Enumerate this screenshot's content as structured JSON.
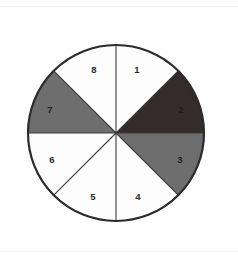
{
  "figure": {
    "name": "eight-sector-shaded-disk",
    "background_color": "#fefefe",
    "circle": {
      "center_x": 116,
      "center_y": 133,
      "radius": 88,
      "outline_color": "#2b2b2b",
      "outline_width": 2.2
    },
    "divider_color": "#3a3a3a",
    "divider_width": 1.1,
    "palette": {
      "white": "#fdfdfd",
      "gray": "#6e6e6e",
      "dark": "#332c2a",
      "label_dark": "#2a2a2a",
      "label_light": "#1a1a1a"
    },
    "sectors": [
      {
        "label": "1",
        "start_angle": 270,
        "end_angle": 315,
        "fill": "#fdfdfd",
        "shade": "white",
        "label_x": 137,
        "label_y": 70,
        "label_color": "#2a2a2a"
      },
      {
        "label": "2",
        "start_angle": 315,
        "end_angle": 360,
        "fill": "#332c2a",
        "shade": "dark",
        "label_x": 181,
        "label_y": 110,
        "label_color": "#1a1a1a"
      },
      {
        "label": "3",
        "start_angle": 0,
        "end_angle": 45,
        "fill": "#6e6e6e",
        "shade": "gray",
        "label_x": 180,
        "label_y": 160,
        "label_color": "#1f1f1f"
      },
      {
        "label": "4",
        "start_angle": 45,
        "end_angle": 90,
        "fill": "#fdfdfd",
        "shade": "white",
        "label_x": 138,
        "label_y": 197,
        "label_color": "#2a2a2a"
      },
      {
        "label": "5",
        "start_angle": 90,
        "end_angle": 135,
        "fill": "#fdfdfd",
        "shade": "white",
        "label_x": 93,
        "label_y": 197,
        "label_color": "#2a2a2a"
      },
      {
        "label": "6",
        "start_angle": 135,
        "end_angle": 180,
        "fill": "#fdfdfd",
        "shade": "white",
        "label_x": 52,
        "label_y": 160,
        "label_color": "#2a2a2a"
      },
      {
        "label": "7",
        "start_angle": 180,
        "end_angle": 225,
        "fill": "#6e6e6e",
        "shade": "gray",
        "label_x": 50,
        "label_y": 110,
        "label_color": "#1f1f1f"
      },
      {
        "label": "8",
        "start_angle": 225,
        "end_angle": 270,
        "fill": "#fdfdfd",
        "shade": "white",
        "label_x": 94,
        "label_y": 70,
        "label_color": "#2a2a2a"
      }
    ]
  },
  "chart_data": {
    "type": "pie",
    "title": "",
    "xlabel": "",
    "ylabel": "",
    "categories": [
      "1",
      "2",
      "3",
      "4",
      "5",
      "6",
      "7",
      "8"
    ],
    "values": [
      12.5,
      12.5,
      12.5,
      12.5,
      12.5,
      12.5,
      12.5,
      12.5
    ],
    "units": "percent",
    "slice_count": 8,
    "equal_slices": true,
    "slice_angle_degrees": 45,
    "start_angle_degrees": 270,
    "direction": "clockwise-numbering-from-top-right",
    "colors": [
      "#fdfdfd",
      "#332c2a",
      "#6e6e6e",
      "#fdfdfd",
      "#fdfdfd",
      "#fdfdfd",
      "#6e6e6e",
      "#fdfdfd"
    ],
    "shading": [
      "white",
      "dark",
      "gray",
      "white",
      "white",
      "white",
      "gray",
      "white"
    ],
    "legend": "none",
    "grid": false,
    "annotations": [
      "Sector numbers 1 through 8 printed inside each slice"
    ]
  }
}
